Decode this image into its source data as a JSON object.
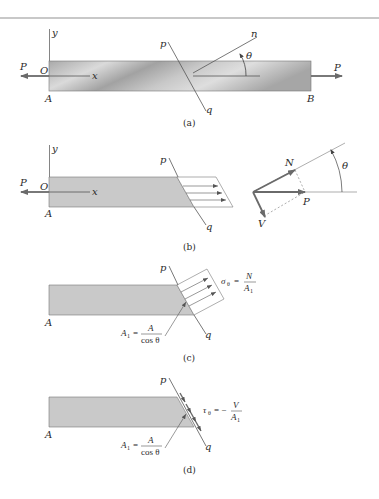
{
  "figure": {
    "top_rule_color": "#c8c8c8",
    "bar_fill_light": "#e2e2e2",
    "bar_fill_dark": "#9c9c9c",
    "bar_fill_flat": "#cfcfcf",
    "arrow_color": "#6a6a6a",
    "line_color": "#555555"
  },
  "part_a": {
    "caption": "(a)",
    "labels": {
      "y_axis": "y",
      "x_axis": "x",
      "origin": "O",
      "left_force": "P",
      "right_force": "P",
      "left_end": "A",
      "right_end": "B",
      "cut_top": "p",
      "cut_bottom": "q",
      "normal": "n",
      "angle": "θ"
    }
  },
  "part_b": {
    "caption": "(b)",
    "labels": {
      "y_axis": "y",
      "x_axis": "x",
      "origin": "O",
      "left_force": "P",
      "left_end": "A",
      "cut_top": "p",
      "cut_bottom": "q",
      "normal_force": "N",
      "shear_force": "V",
      "resultant_force": "P",
      "angle": "θ"
    }
  },
  "part_c": {
    "caption": "(c)",
    "labels": {
      "left_end": "A",
      "cut_top": "p",
      "cut_bottom": "q"
    },
    "stress_eq": {
      "lhs": "σ",
      "lhs_sub": "θ",
      "equals": "=",
      "numerator": "N",
      "denominator": "A",
      "denominator_sub": "1"
    },
    "area_eq": {
      "lhs": "A",
      "lhs_sub": "1",
      "equals": "=",
      "numerator": "A",
      "denominator": "cos θ"
    }
  },
  "part_d": {
    "caption": "(d)",
    "labels": {
      "left_end": "A",
      "cut_top": "p",
      "cut_bottom": "q"
    },
    "stress_eq": {
      "lhs": "τ",
      "lhs_sub": "θ",
      "equals": "= −",
      "numerator": "V",
      "denominator": "A",
      "denominator_sub": "1"
    },
    "area_eq": {
      "lhs": "A",
      "lhs_sub": "1",
      "equals": "=",
      "numerator": "A",
      "denominator": "cos θ"
    }
  }
}
